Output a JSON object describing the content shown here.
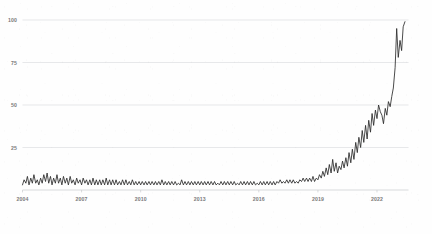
{
  "chart_data": {
    "type": "line",
    "title": "",
    "subtitle": "",
    "xlabel": "",
    "ylabel": "",
    "xlim": [
      2004.0,
      2023.6
    ],
    "ylim": [
      0,
      100
    ],
    "grid": true,
    "legend": null,
    "y_ticks": [
      25,
      50,
      75,
      100
    ],
    "y_tick_labels": [
      "25",
      "50",
      "75",
      "100"
    ],
    "x_ticks": [
      2004,
      2007,
      2010,
      2013,
      2016,
      2019,
      2022
    ],
    "x_tick_labels": [
      "2004",
      "2007",
      "2010",
      "2013",
      "2016",
      "2019",
      "2022"
    ],
    "line_color": "#2b2b2b",
    "grid_color": "#d6d9db",
    "axis_color": "#c8ccce",
    "tick_label_color": "#7a7a7a",
    "background_color": "#fefefe",
    "series": [
      {
        "name": "interest",
        "x": [
          2004.0,
          2004.08,
          2004.17,
          2004.25,
          2004.33,
          2004.42,
          2004.5,
          2004.58,
          2004.67,
          2004.75,
          2004.83,
          2004.92,
          2005.0,
          2005.08,
          2005.17,
          2005.25,
          2005.33,
          2005.42,
          2005.5,
          2005.58,
          2005.67,
          2005.75,
          2005.83,
          2005.92,
          2006.0,
          2006.08,
          2006.17,
          2006.25,
          2006.33,
          2006.42,
          2006.5,
          2006.58,
          2006.67,
          2006.75,
          2006.83,
          2006.92,
          2007.0,
          2007.08,
          2007.17,
          2007.25,
          2007.33,
          2007.42,
          2007.5,
          2007.58,
          2007.67,
          2007.75,
          2007.83,
          2007.92,
          2008.0,
          2008.08,
          2008.17,
          2008.25,
          2008.33,
          2008.42,
          2008.5,
          2008.58,
          2008.67,
          2008.75,
          2008.83,
          2008.92,
          2009.0,
          2009.08,
          2009.17,
          2009.25,
          2009.33,
          2009.42,
          2009.5,
          2009.58,
          2009.67,
          2009.75,
          2009.83,
          2009.92,
          2010.0,
          2010.08,
          2010.17,
          2010.25,
          2010.33,
          2010.42,
          2010.5,
          2010.58,
          2010.67,
          2010.75,
          2010.83,
          2010.92,
          2011.0,
          2011.08,
          2011.17,
          2011.25,
          2011.33,
          2011.42,
          2011.5,
          2011.58,
          2011.67,
          2011.75,
          2011.83,
          2011.92,
          2012.0,
          2012.08,
          2012.17,
          2012.25,
          2012.33,
          2012.42,
          2012.5,
          2012.58,
          2012.67,
          2012.75,
          2012.83,
          2012.92,
          2013.0,
          2013.08,
          2013.17,
          2013.25,
          2013.33,
          2013.42,
          2013.5,
          2013.58,
          2013.67,
          2013.75,
          2013.83,
          2013.92,
          2014.0,
          2014.08,
          2014.17,
          2014.25,
          2014.33,
          2014.42,
          2014.5,
          2014.58,
          2014.67,
          2014.75,
          2014.83,
          2014.92,
          2015.0,
          2015.08,
          2015.17,
          2015.25,
          2015.33,
          2015.42,
          2015.5,
          2015.58,
          2015.67,
          2015.75,
          2015.83,
          2015.92,
          2016.0,
          2016.08,
          2016.17,
          2016.25,
          2016.33,
          2016.42,
          2016.5,
          2016.58,
          2016.67,
          2016.75,
          2016.83,
          2016.92,
          2017.0,
          2017.08,
          2017.17,
          2017.25,
          2017.33,
          2017.42,
          2017.5,
          2017.58,
          2017.67,
          2017.75,
          2017.83,
          2017.92,
          2018.0,
          2018.08,
          2018.17,
          2018.25,
          2018.33,
          2018.42,
          2018.5,
          2018.58,
          2018.67,
          2018.75,
          2018.83,
          2018.92,
          2019.0,
          2019.08,
          2019.17,
          2019.25,
          2019.33,
          2019.42,
          2019.5,
          2019.58,
          2019.67,
          2019.75,
          2019.83,
          2019.92,
          2020.0,
          2020.08,
          2020.17,
          2020.25,
          2020.33,
          2020.42,
          2020.5,
          2020.58,
          2020.67,
          2020.75,
          2020.83,
          2020.92,
          2021.0,
          2021.08,
          2021.17,
          2021.25,
          2021.33,
          2021.42,
          2021.5,
          2021.58,
          2021.67,
          2021.75,
          2021.83,
          2021.92,
          2022.0,
          2022.08,
          2022.17,
          2022.25,
          2022.33,
          2022.42,
          2022.5,
          2022.58,
          2022.67,
          2022.75,
          2022.83,
          2022.92,
          2023.0,
          2023.08,
          2023.17,
          2023.25,
          2023.33,
          2023.42
        ],
        "values": [
          3,
          6,
          4,
          8,
          3,
          7,
          4,
          9,
          4,
          6,
          3,
          7,
          4,
          9,
          5,
          10,
          4,
          8,
          3,
          7,
          4,
          9,
          4,
          7,
          3,
          8,
          4,
          7,
          3,
          8,
          4,
          6,
          3,
          7,
          4,
          6,
          3,
          7,
          4,
          6,
          3,
          6,
          3,
          7,
          3,
          6,
          3,
          6,
          3,
          6,
          3,
          7,
          3,
          6,
          3,
          6,
          3,
          6,
          3,
          5,
          3,
          6,
          3,
          6,
          3,
          5,
          3,
          6,
          3,
          5,
          3,
          5,
          3,
          5,
          3,
          5,
          3,
          5,
          3,
          5,
          3,
          5,
          3,
          5,
          3,
          6,
          3,
          5,
          3,
          5,
          3,
          5,
          3,
          5,
          3,
          4,
          3,
          6,
          3,
          5,
          3,
          5,
          3,
          5,
          3,
          5,
          3,
          5,
          3,
          5,
          3,
          5,
          3,
          5,
          3,
          5,
          3,
          5,
          3,
          4,
          3,
          5,
          3,
          5,
          3,
          5,
          3,
          5,
          3,
          5,
          3,
          4,
          3,
          5,
          3,
          5,
          3,
          5,
          3,
          5,
          3,
          5,
          3,
          4,
          3,
          5,
          3,
          5,
          3,
          5,
          3,
          5,
          3,
          5,
          3,
          5,
          4,
          6,
          4,
          5,
          4,
          6,
          4,
          6,
          4,
          6,
          4,
          5,
          4,
          6,
          5,
          7,
          5,
          7,
          5,
          7,
          5,
          8,
          5,
          7,
          6,
          9,
          7,
          11,
          8,
          13,
          9,
          15,
          10,
          18,
          11,
          16,
          10,
          14,
          12,
          17,
          13,
          19,
          14,
          22,
          16,
          24,
          18,
          28,
          22,
          31,
          25,
          35,
          28,
          38,
          30,
          41,
          34,
          45,
          38,
          47,
          42,
          50,
          46,
          44,
          39,
          48,
          44,
          52,
          49,
          55,
          60,
          72,
          95,
          78,
          88,
          82,
          96,
          99
        ]
      }
    ]
  }
}
